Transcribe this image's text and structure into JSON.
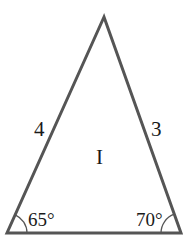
{
  "diagram": {
    "shape": "triangle",
    "stroke_color": "#555555",
    "vertices": {
      "apex": [
        104,
        17
      ],
      "bottom_left": [
        7,
        233
      ],
      "bottom_right": [
        181,
        233
      ]
    },
    "side_labels": {
      "left": "4",
      "right": "3"
    },
    "region_label": "I",
    "angles": {
      "bottom_left": "65°",
      "bottom_right": "70°"
    }
  }
}
